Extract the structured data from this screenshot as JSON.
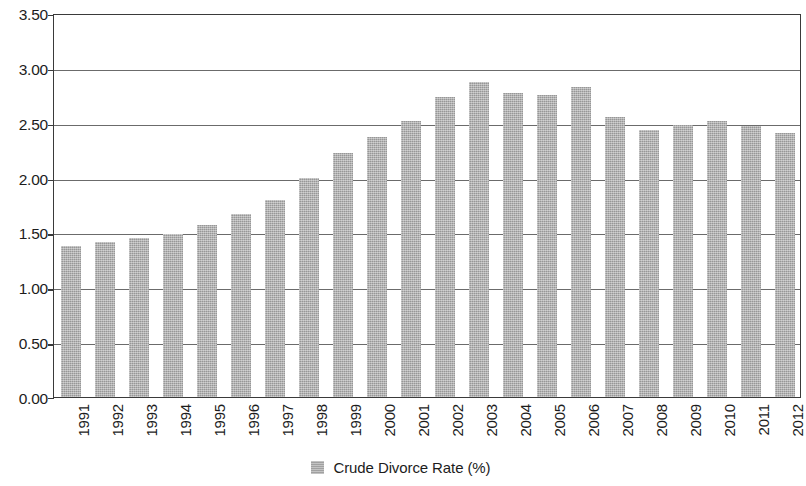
{
  "chart_data": {
    "type": "bar",
    "title": "",
    "xlabel": "",
    "ylabel": "",
    "ylim": [
      0.0,
      3.5
    ],
    "ytick_step": 0.5,
    "ytick_labels": [
      "3.50",
      "3.00",
      "2.50",
      "2.00",
      "1.50",
      "1.00",
      "0.50",
      "0.00"
    ],
    "ytick_values": [
      3.5,
      3.0,
      2.5,
      2.0,
      1.5,
      1.0,
      0.5,
      0.0
    ],
    "grid": true,
    "legend_position": "bottom-center",
    "bar_color": "#a9a9a9",
    "axis_color": "#3a3a3a",
    "gridline_color": "#6b6b6b",
    "categories": [
      "1991",
      "1992",
      "1993",
      "1994",
      "1995",
      "1996",
      "1997",
      "1998",
      "1999",
      "2000",
      "2001",
      "2002",
      "2003",
      "2004",
      "2005",
      "2006",
      "2007",
      "2008",
      "2009",
      "2010",
      "2011",
      "2012"
    ],
    "series": [
      {
        "name": "Crude Divorce Rate (%)",
        "values": [
          1.38,
          1.41,
          1.45,
          1.49,
          1.57,
          1.67,
          1.8,
          2.0,
          2.22,
          2.37,
          2.52,
          2.73,
          2.87,
          2.77,
          2.75,
          2.83,
          2.55,
          2.43,
          2.48,
          2.52,
          2.47,
          2.41
        ]
      }
    ]
  },
  "legend": {
    "entries": [
      {
        "label": "Crude Divorce Rate (%)",
        "color": "#a9a9a9"
      }
    ]
  }
}
